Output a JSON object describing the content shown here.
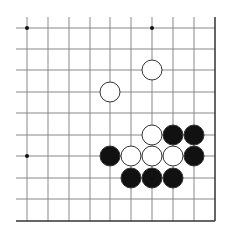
{
  "diagram": {
    "type": "go-board-fragment",
    "grid": {
      "columns_x": [
        27,
        48,
        69,
        90,
        110,
        131,
        152,
        173,
        194
      ],
      "rows_y": [
        28,
        49,
        70,
        92,
        113,
        135,
        156,
        178,
        199
      ],
      "line_top": 17,
      "line_left": 16,
      "right_edge_x": 215,
      "bottom_edge_y": 221,
      "line_color": "#888888",
      "edge_color": "#333333"
    },
    "star_points": [
      {
        "col": 0,
        "row": 0
      },
      {
        "col": 6,
        "row": 0
      },
      {
        "col": 0,
        "row": 6
      }
    ],
    "stones": [
      {
        "color": "white",
        "col": 6,
        "row": 2
      },
      {
        "color": "white",
        "col": 4,
        "row": 3
      },
      {
        "color": "white",
        "col": 6,
        "row": 5
      },
      {
        "color": "black",
        "col": 7,
        "row": 5
      },
      {
        "color": "black",
        "col": 8,
        "row": 5
      },
      {
        "color": "black",
        "col": 4,
        "row": 6
      },
      {
        "color": "white",
        "col": 5,
        "row": 6
      },
      {
        "color": "white",
        "col": 6,
        "row": 6
      },
      {
        "color": "white",
        "col": 7,
        "row": 6
      },
      {
        "color": "black",
        "col": 8,
        "row": 6
      },
      {
        "color": "black",
        "col": 5,
        "row": 7
      },
      {
        "color": "black",
        "col": 6,
        "row": 7
      },
      {
        "color": "black",
        "col": 7,
        "row": 7
      }
    ],
    "stone_radius": 10,
    "colors": {
      "black": "#111111",
      "white": "#ffffff",
      "stone_outline": "#333333"
    }
  }
}
